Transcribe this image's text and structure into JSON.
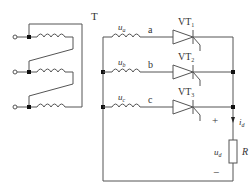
{
  "transformer": {
    "label": "T"
  },
  "phases": [
    {
      "voltage": "u",
      "sub": "a",
      "node": "a",
      "scr": "VT",
      "scr_sub": "1"
    },
    {
      "voltage": "u",
      "sub": "b",
      "node": "b",
      "scr": "VT",
      "scr_sub": "2"
    },
    {
      "voltage": "u",
      "sub": "c",
      "node": "c",
      "scr": "VT",
      "scr_sub": "3"
    }
  ],
  "load": {
    "resistor": "R",
    "voltage": "u",
    "voltage_sub": "d",
    "current": "i",
    "current_sub": "d",
    "plus": "+",
    "minus": "−"
  },
  "colors": {
    "wire": "#555555",
    "junction": "#111111"
  }
}
